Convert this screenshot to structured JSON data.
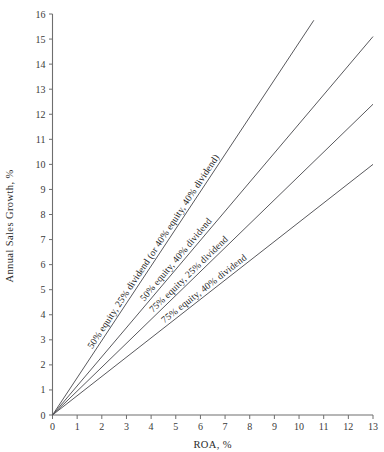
{
  "chart_data": {
    "type": "line",
    "title": "",
    "xlabel": "ROA, %",
    "ylabel": "Annual Sales Growth, %",
    "xlim": [
      0,
      13
    ],
    "ylim": [
      0,
      16
    ],
    "xticks": [
      0,
      1,
      2,
      3,
      4,
      5,
      6,
      7,
      8,
      9,
      10,
      11,
      12,
      13
    ],
    "yticks": [
      0,
      1,
      2,
      3,
      4,
      5,
      6,
      7,
      8,
      9,
      10,
      11,
      12,
      13,
      14,
      15,
      16
    ],
    "grid": false,
    "legend_position": "inline-rotated-labels",
    "series": [
      {
        "name": "50% equity, 25% dividend (or 40% equity, 40% dividend)",
        "slope": 1.485,
        "intercept": 0,
        "x": [
          0,
          10.6
        ],
        "values": [
          0,
          15.75
        ],
        "label_anchor_x": 4.3,
        "color": "#59595d"
      },
      {
        "name": "50% equity, 40% dividend",
        "slope": 1.162,
        "intercept": 0,
        "x": [
          0,
          13
        ],
        "values": [
          0,
          15.1
        ],
        "label_anchor_x": 5.2,
        "color": "#59595d"
      },
      {
        "name": "75% equity, 25% dividend",
        "slope": 0.954,
        "intercept": 0,
        "x": [
          0,
          13
        ],
        "values": [
          0,
          12.4
        ],
        "label_anchor_x": 5.7,
        "color": "#59595d"
      },
      {
        "name": "75% equity, 40% dividend",
        "slope": 0.769,
        "intercept": 0,
        "x": [
          0,
          13
        ],
        "values": [
          0,
          10.0
        ],
        "label_anchor_x": 6.3,
        "color": "#59595d"
      }
    ]
  },
  "axes": {
    "x_tick_labels": [
      "0",
      "1",
      "2",
      "3",
      "4",
      "5",
      "6",
      "7",
      "8",
      "9",
      "10",
      "11",
      "12",
      "13"
    ],
    "y_tick_labels": [
      "0",
      "1",
      "2",
      "3",
      "4",
      "5",
      "6",
      "7",
      "8",
      "9",
      "10",
      "11",
      "12",
      "13",
      "14",
      "15",
      "16"
    ],
    "x_axis_title": "ROA, %",
    "y_axis_title": "Annual Sales Growth, %"
  }
}
